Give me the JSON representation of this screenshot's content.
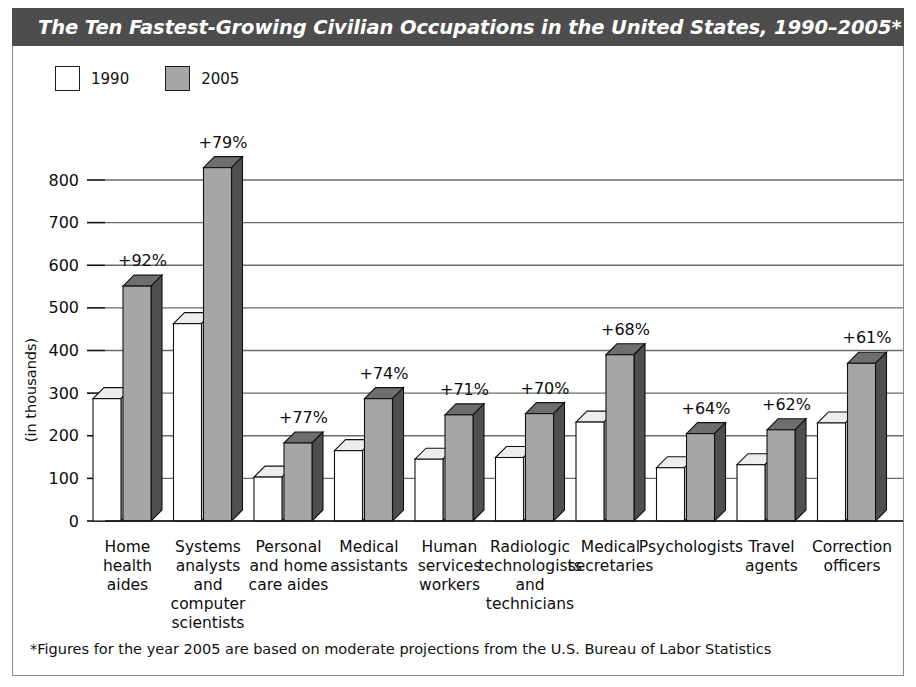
{
  "header": {
    "title": "The Ten Fastest-Growing Civilian Occupations in the United States, 1990–2005*"
  },
  "legend": {
    "items": [
      {
        "label": "1990",
        "swatch": "white",
        "color": "#ffffff"
      },
      {
        "label": "2005",
        "swatch": "gray",
        "color": "#a6a6a6"
      }
    ]
  },
  "footnote": {
    "text": "*Figures for the year 2005 are based on moderate projections from the U.S. Bureau of Labor Statistics"
  },
  "colors": {
    "title_bar": "#4d4d4d",
    "bar_1990_front": "#ffffff",
    "bar_1990_side": "#d9d9d9",
    "bar_1990_top": "#ededed",
    "bar_2005_front": "#a6a6a6",
    "bar_2005_side": "#4f4f4f",
    "bar_2005_top": "#6e6e6e",
    "outline": "#111111",
    "gridline": "#6b6b6b"
  },
  "chart_data": {
    "type": "bar",
    "title": "The Ten Fastest-Growing Civilian Occupations in the United States, 1990–2005*",
    "xlabel": "",
    "ylabel": "(in thousands)",
    "ylim": [
      0,
      800
    ],
    "yticks": [
      0,
      100,
      200,
      300,
      400,
      500,
      600,
      700,
      800
    ],
    "grid": true,
    "legend_position": "top-left",
    "categories": [
      "Home health aides",
      "Systems analysts and computer scientists",
      "Personal and home care aides",
      "Medical assistants",
      "Human services workers",
      "Radiologic technologists and technicians",
      "Medical secretaries",
      "Psychologists",
      "Travel agents",
      "Correction officers"
    ],
    "category_lines": [
      [
        "Home",
        "health",
        "aides"
      ],
      [
        "Systems",
        "analysts",
        "and",
        "computer",
        "scientists"
      ],
      [
        "Personal",
        "and home",
        "care aides"
      ],
      [
        "Medical",
        "assistants"
      ],
      [
        "Human",
        "services",
        "workers"
      ],
      [
        "Radiologic",
        "technologists",
        "and",
        "technicians"
      ],
      [
        "Medical",
        "secretaries"
      ],
      [
        "Psychologists"
      ],
      [
        "Travel",
        "agents"
      ],
      [
        "Correction",
        "officers"
      ]
    ],
    "series": [
      {
        "name": "1990",
        "values": [
          287,
          463,
          103,
          165,
          145,
          149,
          232,
          125,
          132,
          230
        ]
      },
      {
        "name": "2005",
        "values": [
          551,
          829,
          183,
          287,
          249,
          252,
          390,
          205,
          214,
          370
        ]
      }
    ],
    "growth_labels": [
      "+92%",
      "+79%",
      "+77%",
      "+74%",
      "+71%",
      "+70%",
      "+68%",
      "+64%",
      "+62%",
      "+61%"
    ]
  }
}
